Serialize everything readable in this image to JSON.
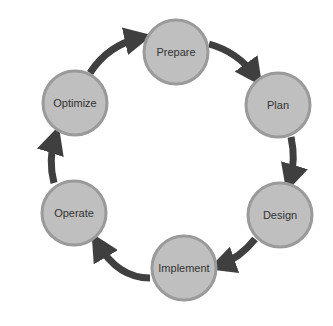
{
  "diagram": {
    "type": "cycle",
    "colors": {
      "node_fill": "#bfbfbf",
      "node_stroke": "#9a9a9a",
      "arrow": "#3f3f3f",
      "text": "#333333"
    },
    "nodes": [
      {
        "id": "prepare",
        "label": "Prepare",
        "cx": 176,
        "cy": 52
      },
      {
        "id": "plan",
        "label": "Plan",
        "cx": 278,
        "cy": 105
      },
      {
        "id": "design",
        "label": "Design",
        "cx": 280,
        "cy": 215
      },
      {
        "id": "implement",
        "label": "Implement",
        "cx": 184,
        "cy": 268
      },
      {
        "id": "operate",
        "label": "Operate",
        "cx": 74,
        "cy": 213
      },
      {
        "id": "optimize",
        "label": "Optimize",
        "cx": 75,
        "cy": 103
      }
    ],
    "edges": [
      {
        "from": "Prepare",
        "to": "Plan"
      },
      {
        "from": "Plan",
        "to": "Design"
      },
      {
        "from": "Design",
        "to": "Implement"
      },
      {
        "from": "Implement",
        "to": "Operate"
      },
      {
        "from": "Operate",
        "to": "Optimize"
      },
      {
        "from": "Optimize",
        "to": "Prepare"
      }
    ]
  }
}
